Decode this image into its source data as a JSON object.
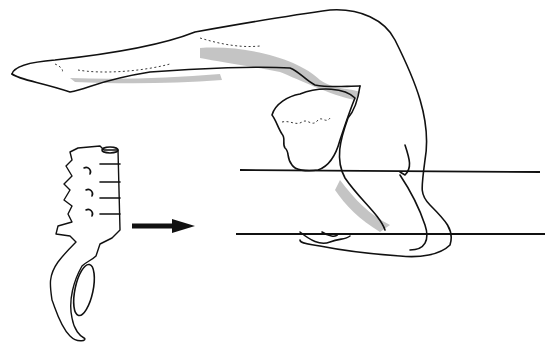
{
  "figure": {
    "elements": {
      "figure": "contortion-backbend-figure",
      "inset": "lumbar-spine-sacrum",
      "arrow": "right-arrow"
    },
    "colors": {
      "ink": "#111111",
      "background": "#ffffff"
    }
  }
}
